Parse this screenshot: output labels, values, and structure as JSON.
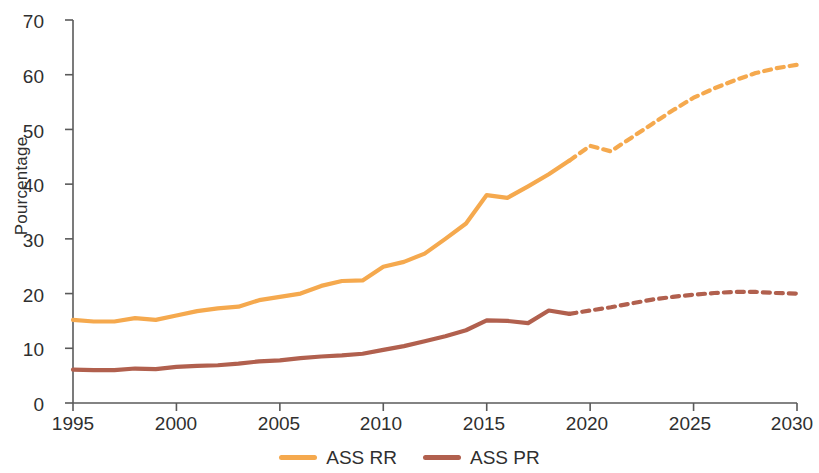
{
  "chart_data": {
    "type": "line",
    "title": "",
    "xlabel": "",
    "ylabel": "Pourcentage",
    "xlim": [
      1995,
      2030
    ],
    "ylim": [
      0,
      70
    ],
    "grid": false,
    "legend_position": "bottom-center",
    "x_ticks": [
      "1995",
      "2000",
      "2005",
      "2010",
      "2015",
      "2020",
      "2025",
      "2030"
    ],
    "y_ticks": [
      "0",
      "10",
      "20",
      "30",
      "40",
      "50",
      "60",
      "70"
    ],
    "x": [
      1995,
      1996,
      1997,
      1998,
      1999,
      2000,
      2001,
      2002,
      2003,
      2004,
      2005,
      2006,
      2007,
      2008,
      2009,
      2010,
      2011,
      2012,
      2013,
      2014,
      2015,
      2016,
      2017,
      2018,
      2019,
      2020,
      2021,
      2022,
      2023,
      2024,
      2025,
      2026,
      2027,
      2028,
      2029,
      2030
    ],
    "series": [
      {
        "name": "ASS RR",
        "color": "#F5A94E",
        "style": "solid-then-dashed",
        "dash_starts_at": 2019,
        "values": [
          15.2,
          14.9,
          14.9,
          15.5,
          15.2,
          16.0,
          16.8,
          17.3,
          17.6,
          18.8,
          19.4,
          20.0,
          21.4,
          22.3,
          22.4,
          24.9,
          25.8,
          27.3,
          30.0,
          32.8,
          38.0,
          37.5,
          39.6,
          41.8,
          44.3,
          47.0,
          46.0,
          48.5,
          51.0,
          53.5,
          55.8,
          57.5,
          59.0,
          60.3,
          61.2,
          61.8
        ]
      },
      {
        "name": "ASS PR",
        "color": "#B1604E",
        "style": "solid-then-dashed",
        "dash_starts_at": 2019,
        "values": [
          6.1,
          6.0,
          6.0,
          6.3,
          6.2,
          6.6,
          6.8,
          6.9,
          7.2,
          7.6,
          7.8,
          8.2,
          8.5,
          8.7,
          9.0,
          9.7,
          10.4,
          11.3,
          12.2,
          13.3,
          15.1,
          15.0,
          14.6,
          16.9,
          16.3,
          16.9,
          17.5,
          18.2,
          18.9,
          19.4,
          19.8,
          20.1,
          20.3,
          20.3,
          20.1,
          20.0
        ]
      }
    ]
  },
  "legend": {
    "items": [
      {
        "label": "ASS RR",
        "color": "#F5A94E"
      },
      {
        "label": "ASS PR",
        "color": "#B1604E"
      }
    ]
  },
  "axes": {
    "y_label": "Pourcentage",
    "axis_color": "#5a5a5a"
  }
}
